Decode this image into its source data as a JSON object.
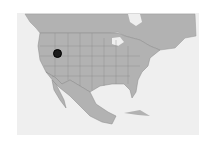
{
  "map": {
    "region": "North America",
    "land_color": "#b2b2b2",
    "water_color": "#efefef",
    "border_color": "#888888",
    "marker": {
      "label": "",
      "x": 57,
      "y": 53,
      "color": "#1c1c1c"
    }
  }
}
